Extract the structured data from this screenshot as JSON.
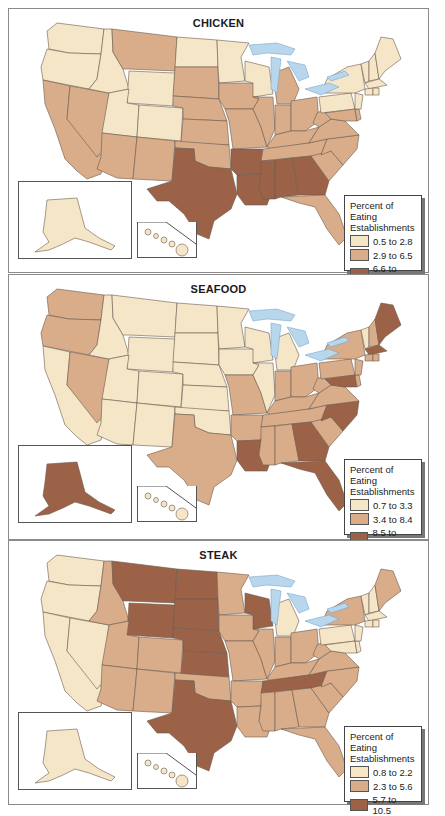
{
  "colors": {
    "low": "#f5e6c8",
    "mid": "#d9ad8a",
    "high": "#9b6248",
    "water": "#b8d6ec",
    "border": "#6b5a4e"
  },
  "chart_data": [
    {
      "type": "heatmap",
      "subtype": "choropleth",
      "title": "CHICKEN",
      "legend_title": "Percent of Eating Establishments",
      "classes": [
        {
          "label": "0.5 to 2.8",
          "min": 0.5,
          "max": 2.8,
          "color": "#f5e6c8"
        },
        {
          "label": "2.9 to 6.5",
          "min": 2.9,
          "max": 6.5,
          "color": "#d9ad8a"
        },
        {
          "label": "6.6 to 11.2",
          "min": 6.6,
          "max": 11.2,
          "color": "#9b6248"
        }
      ],
      "states": {
        "low": [
          "WA",
          "OR",
          "ID",
          "WY",
          "UT",
          "CO",
          "ND",
          "MN",
          "WI",
          "NY",
          "PA",
          "VT",
          "NH",
          "ME",
          "MA",
          "CT",
          "RI",
          "NJ",
          "AK",
          "HI"
        ],
        "mid": [
          "CA",
          "NV",
          "AZ",
          "NM",
          "MT",
          "SD",
          "NE",
          "KS",
          "OK",
          "IA",
          "MO",
          "IL",
          "IN",
          "MI",
          "OH",
          "KY",
          "TN",
          "WV",
          "VA",
          "NC",
          "SC",
          "FL",
          "MD",
          "DE"
        ],
        "high": [
          "TX",
          "AR",
          "LA",
          "MS",
          "AL",
          "GA"
        ]
      }
    },
    {
      "type": "heatmap",
      "subtype": "choropleth",
      "title": "SEAFOOD",
      "legend_title": "Percent of Eating Establishments",
      "classes": [
        {
          "label": "0.7 to 3.3",
          "min": 0.7,
          "max": 3.3,
          "color": "#f5e6c8"
        },
        {
          "label": "3.4 to 8.4",
          "min": 3.4,
          "max": 8.4,
          "color": "#d9ad8a"
        },
        {
          "label": "8.5 to 15.6",
          "min": 8.5,
          "max": 15.6,
          "color": "#9b6248"
        }
      ],
      "states": {
        "low": [
          "CA",
          "ID",
          "MT",
          "WY",
          "UT",
          "CO",
          "AZ",
          "NM",
          "ND",
          "SD",
          "NE",
          "KS",
          "OK",
          "MN",
          "IA",
          "WI",
          "IL",
          "MI",
          "VT",
          "HI"
        ],
        "mid": [
          "WA",
          "OR",
          "NV",
          "TX",
          "MO",
          "AR",
          "MS",
          "AL",
          "TN",
          "KY",
          "IN",
          "OH",
          "WV",
          "VA",
          "PA",
          "NY",
          "NH",
          "CT",
          "RI",
          "NJ",
          "DE",
          "SC"
        ],
        "high": [
          "ME",
          "MA",
          "MD",
          "NC",
          "GA",
          "FL",
          "LA",
          "AK"
        ]
      }
    },
    {
      "type": "heatmap",
      "subtype": "choropleth",
      "title": "STEAK",
      "legend_title": "Percent of Eating Establishments",
      "classes": [
        {
          "label": "0.8 to 2.2",
          "min": 0.8,
          "max": 2.2,
          "color": "#f5e6c8"
        },
        {
          "label": "2.3 to 5.6",
          "min": 2.3,
          "max": 5.6,
          "color": "#d9ad8a"
        },
        {
          "label": "5.7 to 10.5",
          "min": 5.7,
          "max": 10.5,
          "color": "#9b6248"
        }
      ],
      "states": {
        "low": [
          "WA",
          "OR",
          "CA",
          "NV",
          "MI",
          "PA",
          "VT",
          "NH",
          "MA",
          "CT",
          "RI",
          "NJ",
          "DE",
          "MD",
          "AK",
          "HI"
        ],
        "mid": [
          "ID",
          "UT",
          "AZ",
          "CO",
          "NM",
          "MN",
          "IA",
          "MO",
          "AR",
          "LA",
          "MS",
          "AL",
          "GA",
          "FL",
          "SC",
          "NC",
          "VA",
          "WV",
          "KY",
          "IL",
          "IN",
          "OH",
          "NY",
          "ME",
          "OK"
        ],
        "high": [
          "MT",
          "WY",
          "ND",
          "SD",
          "NE",
          "KS",
          "TX",
          "WI",
          "TN"
        ]
      }
    }
  ],
  "panels": [
    {
      "title": "CHICKEN",
      "legend": {
        "title_line1": "Percent of Eating",
        "title_line2": "Establishments",
        "items": [
          {
            "label": "0.5 to 2.8"
          },
          {
            "label": "2.9 to 6.5"
          },
          {
            "label": "6.6 to 11.2"
          }
        ]
      }
    },
    {
      "title": "SEAFOOD",
      "legend": {
        "title_line1": "Percent of Eating",
        "title_line2": "Establishments",
        "items": [
          {
            "label": "0.7 to 3.3"
          },
          {
            "label": "3.4 to 8.4"
          },
          {
            "label": "8.5 to 15.6"
          }
        ]
      }
    },
    {
      "title": "STEAK",
      "legend": {
        "title_line1": "Percent of Eating",
        "title_line2": "Establishments",
        "items": [
          {
            "label": "0.8 to 2.2"
          },
          {
            "label": "2.3 to 5.6"
          },
          {
            "label": "5.7 to 10.5"
          }
        ]
      }
    }
  ]
}
